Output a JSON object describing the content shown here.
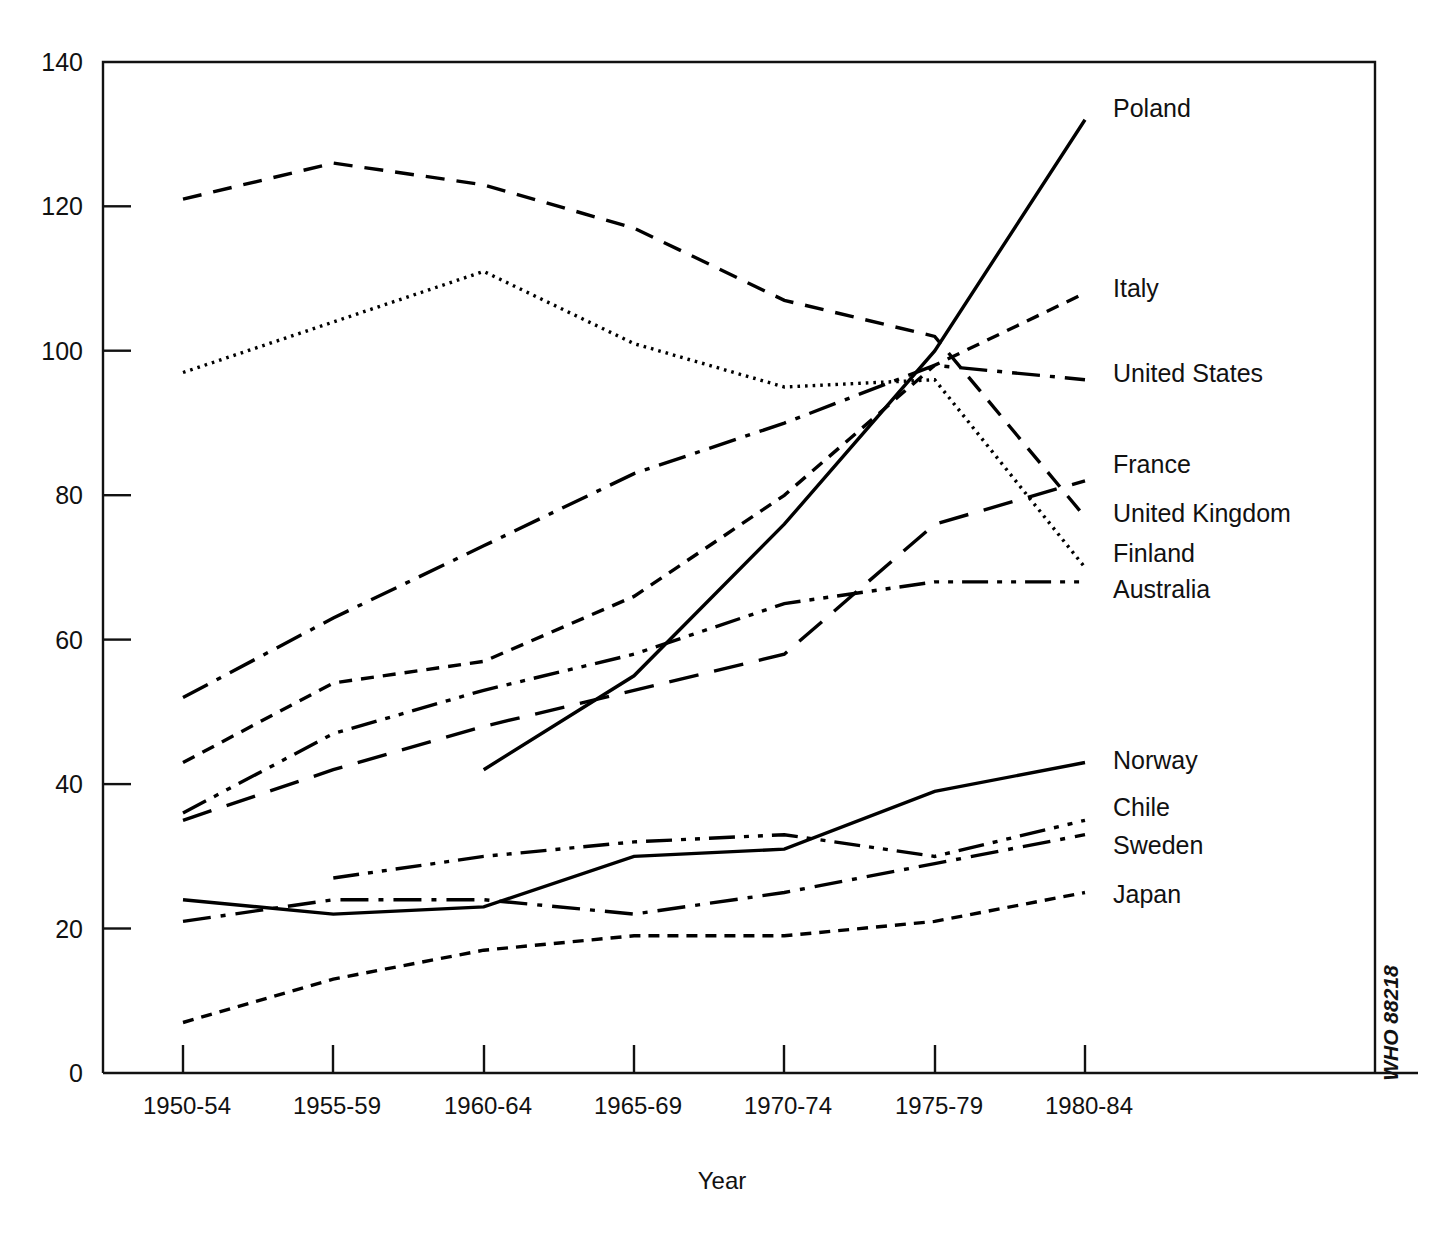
{
  "chart_data": {
    "type": "line",
    "title": "",
    "xlabel": "Year",
    "ylabel": "",
    "ylim": [
      0,
      140
    ],
    "yticks": [
      0,
      20,
      40,
      60,
      80,
      100,
      120,
      140
    ],
    "grid": false,
    "legend_position": "right-inline-end-of-line",
    "categories": [
      "1950-54",
      "1955-59",
      "1960-64",
      "1965-69",
      "1970-74",
      "1975-79",
      "1980-84"
    ],
    "series": [
      {
        "name": "Poland",
        "style": "solid",
        "values": [
          null,
          null,
          42,
          55,
          76,
          100,
          132
        ]
      },
      {
        "name": "Italy",
        "style": "short-dash",
        "values": [
          43,
          54,
          57,
          66,
          80,
          98,
          108
        ]
      },
      {
        "name": "United States",
        "style": "dash-dot",
        "values": [
          52,
          63,
          73,
          83,
          90,
          98,
          96
        ]
      },
      {
        "name": "France",
        "style": "long-dash",
        "values": [
          35,
          42,
          48,
          53,
          58,
          76,
          82
        ]
      },
      {
        "name": "United Kingdom",
        "style": "medium-dash",
        "values": [
          121,
          126,
          123,
          117,
          107,
          102,
          77
        ]
      },
      {
        "name": "Finland",
        "style": "dotted",
        "values": [
          97,
          104,
          111,
          101,
          95,
          96,
          70
        ]
      },
      {
        "name": "Australia",
        "style": "dash-dot-dot",
        "values": [
          36,
          47,
          53,
          58,
          65,
          68,
          68
        ]
      },
      {
        "name": "Norway",
        "style": "solid",
        "values": [
          24,
          22,
          23,
          30,
          31,
          39,
          43
        ]
      },
      {
        "name": "Chile",
        "style": "dash-dot-dot",
        "values": [
          null,
          27,
          30,
          32,
          33,
          30,
          35
        ]
      },
      {
        "name": "Sweden",
        "style": "dash-dot",
        "values": [
          21,
          24,
          24,
          22,
          25,
          29,
          33
        ]
      },
      {
        "name": "Japan",
        "style": "fine-dash",
        "values": [
          7,
          13,
          17,
          19,
          19,
          21,
          25
        ]
      }
    ]
  },
  "axes": {
    "ytick_labels": [
      "0",
      "20",
      "40",
      "60",
      "80",
      "100",
      "120",
      "140"
    ],
    "xtick_labels": [
      "1950-54",
      "1955-59",
      "1960-64",
      "1965-69",
      "1970-74",
      "1975-79",
      "1980-84"
    ],
    "xaxis_title": "Year"
  },
  "series_labels": [
    {
      "name": "Poland",
      "y": 117
    },
    {
      "name": "Italy",
      "y": 297
    },
    {
      "name": "United States",
      "y": 382
    },
    {
      "name": "France",
      "y": 473
    },
    {
      "name": "United Kingdom",
      "y": 522
    },
    {
      "name": "Finland",
      "y": 562
    },
    {
      "name": "Australia",
      "y": 598
    },
    {
      "name": "Norway",
      "y": 769
    },
    {
      "name": "Chile",
      "y": 816
    },
    {
      "name": "Sweden",
      "y": 854
    },
    {
      "name": "Japan",
      "y": 903
    }
  ],
  "credit": {
    "text": "WHO 88218"
  },
  "colors": {
    "ink": "#000000",
    "background": "#ffffff"
  }
}
